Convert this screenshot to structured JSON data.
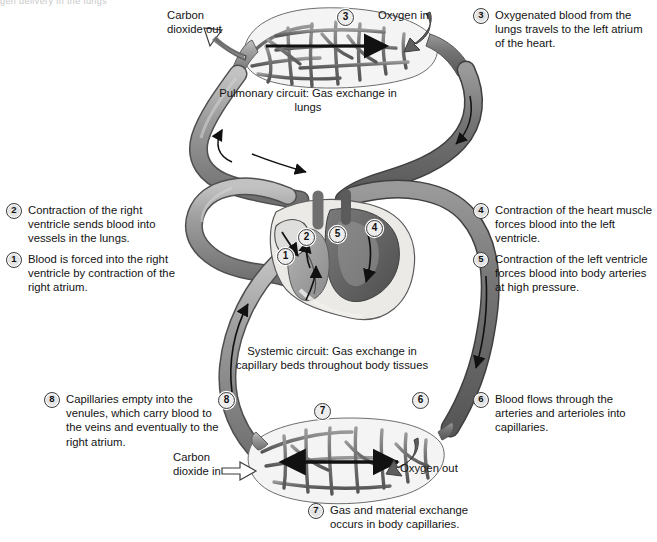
{
  "figure": {
    "title_fragment": "gen delivery in the lungs",
    "type": "human circulatory system diagram",
    "style": "grayscale textbook illustration"
  },
  "labels": {
    "carbon_dioxide_out": "Carbon\ndioxide out",
    "oxygen_in": "Oxygen in",
    "pulmonary_circuit": "Pulmonary circuit: Gas exchange in\nlungs",
    "systemic_circuit": "Systemic circuit: Gas exchange in\ncapillary beds throughout body tissues",
    "carbon_dioxide_in": "Carbon\ndioxide in",
    "oxygen_out": "Oxygen out"
  },
  "callouts": [
    {
      "n": "1",
      "text": "Blood is forced into the right ventricle by contraction of the right atrium."
    },
    {
      "n": "2",
      "text": "Contraction of the right ventricle sends blood into vessels in the lungs."
    },
    {
      "n": "3",
      "text": "Oxygenated blood from the lungs travels to the left atrium of the heart."
    },
    {
      "n": "4",
      "text": "Contraction of the heart muscle forces blood into the left ventricle."
    },
    {
      "n": "5",
      "text": "Contraction of the left ventricle forces blood into body arteries at high pressure."
    },
    {
      "n": "6",
      "text": "Blood flows through the arteries and arterioles into capillaries."
    },
    {
      "n": "7",
      "text": "Gas and material exchange occurs in body capillaries."
    },
    {
      "n": "8",
      "text": "Capillaries empty into the venules, which carry blood to the veins and eventually to the right atrium."
    }
  ],
  "figure_markers": [
    {
      "n": "3",
      "location": "lung capillary bed, upper right"
    },
    {
      "n": "1",
      "location": "right atrium of heart"
    },
    {
      "n": "2",
      "location": "right ventricle of heart"
    },
    {
      "n": "5",
      "location": "left ventricle of heart"
    },
    {
      "n": "4",
      "location": "left atrium / aortic arch of heart"
    },
    {
      "n": "8",
      "location": "venule side of systemic capillary bed"
    },
    {
      "n": "7",
      "location": "systemic capillary bed"
    },
    {
      "n": "6",
      "location": "arteriole side of systemic capillary bed"
    }
  ],
  "colors": {
    "vessel_light": "#a7a7a7",
    "vessel_dark": "#6e6e6e",
    "vessel_outline": "#4a4a4a",
    "heart_dark": "#5d5d5d",
    "heart_mid": "#8c8c8c",
    "heart_pale": "#e8e8e6",
    "background": "#ffffff",
    "text": "#131313"
  }
}
